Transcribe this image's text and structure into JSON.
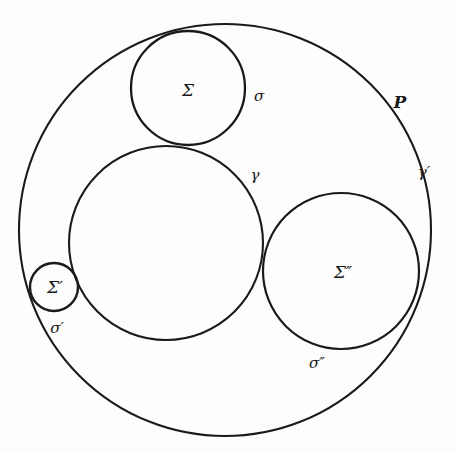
{
  "figure": {
    "kind": "geometric-diagram",
    "background_color": "#fdfdfd",
    "stroke_color": "#1a1a1a",
    "width": 456,
    "height": 451
  },
  "circles": [
    {
      "id": "outer-circle-P",
      "label": "P",
      "cx": 225,
      "cy": 230,
      "r": 206,
      "stroke_width": 2.1
    },
    {
      "id": "circle-gamma",
      "label": "γ",
      "cx": 166,
      "cy": 243,
      "r": 97,
      "stroke_width": 2.1
    },
    {
      "id": "circle-sigma",
      "label": "Σ",
      "cx": 188,
      "cy": 88,
      "r": 57,
      "stroke_width": 2.3
    },
    {
      "id": "circle-sigma-prime",
      "label": "Σ′",
      "cx": 54,
      "cy": 287,
      "r": 24,
      "stroke_width": 2.4
    },
    {
      "id": "circle-sigma-double-prime",
      "label": "Σ″",
      "cx": 341,
      "cy": 271,
      "r": 78,
      "stroke_width": 2.2
    }
  ],
  "labels": {
    "sigma": {
      "text": "Σ",
      "x": 188,
      "y": 90
    },
    "sigma_arc": {
      "text": "σ",
      "x": 259,
      "y": 96
    },
    "gamma": {
      "text": "γ",
      "x": 255,
      "y": 175
    },
    "p": {
      "text": "P",
      "x": 400,
      "y": 102
    },
    "gamma_prime": {
      "text": "γ′",
      "x": 424,
      "y": 172
    },
    "sigma_prime_circle": {
      "text": "Σ′",
      "x": 55,
      "y": 287
    },
    "sigma_prime_arc": {
      "text": "σ′",
      "x": 57,
      "y": 328
    },
    "sigma_double_prime_circle": {
      "text": "Σ″",
      "x": 343,
      "y": 272
    },
    "sigma_double_prime_arc": {
      "text": "σ″",
      "x": 317,
      "y": 363
    }
  }
}
